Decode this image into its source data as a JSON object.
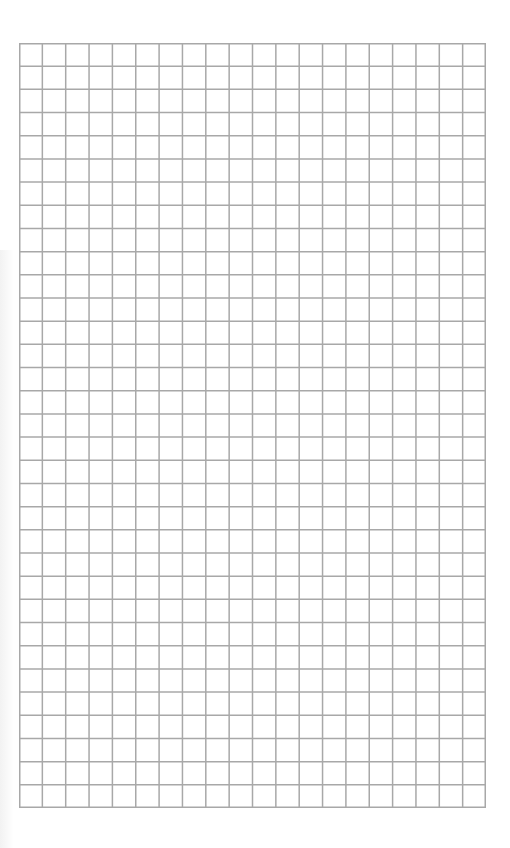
{
  "page": {
    "type": "graph-paper",
    "background": "#ffffff",
    "line_color": "#a8a8a8"
  },
  "grid": {
    "columns": 20,
    "rows": 33,
    "left": 19,
    "top": 43,
    "width": 467,
    "height": 765
  }
}
